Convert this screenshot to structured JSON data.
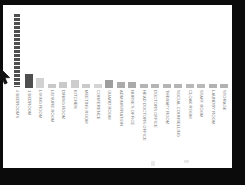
{
  "window": {
    "frame_color": "#0b0b0b",
    "canvas_color": "#ffffff"
  },
  "cursor": {
    "icon": "mouse-pointer-icon",
    "color": "#1a1a1a"
  },
  "chart_data": {
    "type": "bar",
    "title": "",
    "xlabel": "",
    "ylabel": "",
    "grid": false,
    "legend": "none",
    "ylim": [
      0,
      40
    ],
    "bar_color": "#b9b9b9",
    "highlight_color": "#4f4f4f",
    "categories": [
      "4 BEDROOMS",
      "1 BEDROOM",
      "LIVING ROOM",
      "LEISURE ROOM",
      "DINING ROOM",
      "KITCHEN",
      "MEETING ROOM",
      "CONFERENCE",
      "GUARD ROOM",
      "ADMINISTRATION",
      "NURSE'S OFFICE",
      "HEAD DOCTORS OFFICE",
      "DOCTORS OFFICE",
      "THERAPY ROOM",
      "SOCIAL COUNSELLING",
      "CLOAK ROOM",
      "STAFF ROOM",
      "LAUNDRY ROOM",
      "STORAGE"
    ],
    "values": [
      38,
      7,
      5,
      2,
      3,
      4,
      2,
      2,
      4,
      3,
      3,
      2,
      2,
      2,
      2,
      2,
      2,
      2,
      2
    ],
    "colors": [
      "#4f4f4f",
      "#4f4f4f",
      "#d2d2d2",
      "#c9c9c9",
      "#c9c9c9",
      "#cdcdcd",
      "#cacaca",
      "#d4d4d4",
      "#9e9e9e",
      "#ababab",
      "#aaaaaa",
      "#b4b4b4",
      "#b4b4b4",
      "#b4b4b4",
      "#b4b4b4",
      "#b8b8b8",
      "#b8b8b8",
      "#b2b2b2",
      "#b2b2b2"
    ],
    "segmented_index": 0,
    "segment_count": 19
  }
}
